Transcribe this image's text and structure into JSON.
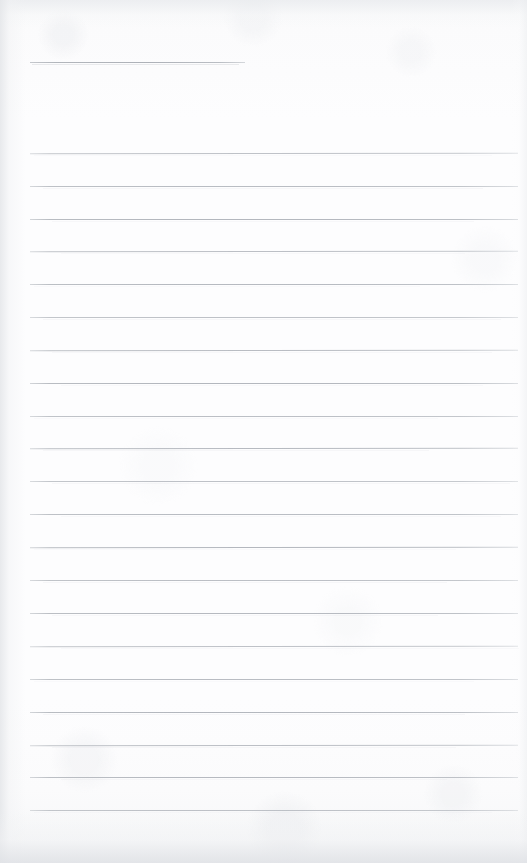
{
  "document": {
    "type": "scanned-blank-lined-notepad-page",
    "title": "",
    "body_text": "",
    "has_handwriting": false,
    "has_printed_text": false,
    "page_number": ""
  },
  "canvas": {
    "width": 527,
    "height": 863
  },
  "colors": {
    "page_background": "#fcfcfd",
    "rule_line": "#b9bcc2",
    "rule_line_dark": "#aeb2b8",
    "edge_shadow": "#e4e6e9",
    "bottom_shadow": "#e0e2e6"
  },
  "header_rule": {
    "label": "",
    "y": 62,
    "x_start": 30,
    "x_end": 245,
    "thickness": 1
  },
  "ruled_lines": {
    "count": 21,
    "x_start": 30,
    "x_end": 518,
    "first_y": 153,
    "spacing": 32.85,
    "thickness": 1,
    "y_positions": [
      153,
      186,
      219,
      251,
      284,
      317,
      350,
      383,
      416,
      448,
      481,
      514,
      547,
      580,
      613,
      646,
      679,
      712,
      745,
      777,
      810
    ]
  },
  "margins": {
    "left": 30,
    "right": 9,
    "top": 62,
    "bottom": 53
  }
}
